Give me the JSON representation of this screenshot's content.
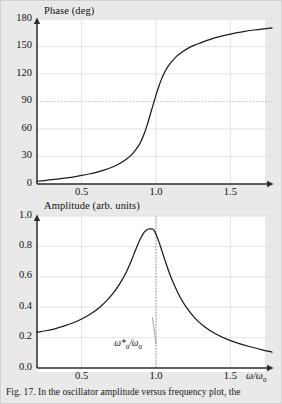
{
  "figure": {
    "background_color": "#e9e9e9",
    "plot_background_color": "#ffffff",
    "axis_color": "#2b2b2b",
    "grid_color": "#dcdcdc",
    "curve_color": "#1a1a1a",
    "caption": "Fig. 17. In the oscillator amplitude versus frequency plot, the"
  },
  "chart_data": [
    {
      "id": "phase-plot",
      "type": "line",
      "title": "",
      "xlabel": "",
      "ylabel": "Phase (deg)",
      "xlim": [
        0.2,
        1.78
      ],
      "ylim": [
        0,
        180
      ],
      "grid": true,
      "legend": "none",
      "xticks": [
        0.5,
        1.0,
        1.5
      ],
      "xticklabels": [
        "0.5",
        "1.0",
        "1.5"
      ],
      "yticks": [
        0,
        30,
        60,
        90,
        120,
        150,
        180
      ],
      "yticklabels": [
        "0",
        "30",
        "60",
        "90",
        "120",
        "150",
        "180"
      ],
      "highlight_gridline_y": 90,
      "series": [
        {
          "name": "phase",
          "x": [
            0.2,
            0.25,
            0.3,
            0.35,
            0.4,
            0.45,
            0.5,
            0.55,
            0.6,
            0.65,
            0.7,
            0.75,
            0.8,
            0.84,
            0.88,
            0.9,
            0.92,
            0.94,
            0.96,
            0.98,
            1.0,
            1.02,
            1.04,
            1.06,
            1.08,
            1.1,
            1.14,
            1.18,
            1.22,
            1.26,
            1.3,
            1.36,
            1.42,
            1.5,
            1.58,
            1.66,
            1.74,
            1.78
          ],
          "y": [
            3.0,
            3.8,
            4.7,
            5.6,
            6.7,
            7.9,
            9.3,
            10.9,
            12.8,
            15.1,
            18.0,
            21.8,
            27.0,
            32.6,
            41.0,
            47.0,
            54.5,
            64.0,
            75.0,
            86.0,
            97.0,
            107.0,
            115.5,
            122.5,
            128.0,
            132.5,
            139.5,
            144.5,
            148.5,
            151.5,
            154.0,
            157.5,
            160.5,
            163.5,
            166.0,
            168.0,
            169.5,
            170.2
          ]
        }
      ]
    },
    {
      "id": "amplitude-plot",
      "type": "line",
      "title": "",
      "xlabel": "ω/ω₀",
      "ylabel": "Amplitude (arb. units)",
      "xlim": [
        0.2,
        1.78
      ],
      "ylim": [
        0.0,
        1.0
      ],
      "grid": true,
      "legend": "none",
      "xticks": [
        0.5,
        1.0,
        1.5
      ],
      "xticklabels": [
        "0.5",
        "1.0",
        "1.5"
      ],
      "yticks": [
        0.0,
        0.2,
        0.4,
        0.6,
        0.8,
        1.0
      ],
      "yticklabels": [
        "0.0",
        "0.2",
        "0.4",
        "0.6",
        "0.8",
        "1.0"
      ],
      "vline_x": 1.0,
      "annotation": {
        "text": "ω*₀/ω₀",
        "base": "ω*",
        "sub1": "0",
        "mid": "/ω",
        "sub2": "0",
        "x": 0.8,
        "y": 0.145,
        "leader_to_x": 0.975,
        "leader_to_y": 0.335
      },
      "peak": {
        "x": 0.975,
        "y": 0.915
      },
      "series": [
        {
          "name": "amplitude",
          "x": [
            0.2,
            0.26,
            0.32,
            0.38,
            0.44,
            0.5,
            0.56,
            0.62,
            0.68,
            0.72,
            0.76,
            0.8,
            0.83,
            0.86,
            0.88,
            0.9,
            0.92,
            0.94,
            0.955,
            0.965,
            0.975,
            0.985,
            1.0,
            1.02,
            1.04,
            1.06,
            1.09,
            1.12,
            1.16,
            1.2,
            1.26,
            1.32,
            1.4,
            1.48,
            1.56,
            1.64,
            1.72,
            1.78
          ],
          "y": [
            0.235,
            0.245,
            0.258,
            0.275,
            0.296,
            0.322,
            0.355,
            0.398,
            0.455,
            0.502,
            0.56,
            0.63,
            0.695,
            0.77,
            0.818,
            0.86,
            0.892,
            0.91,
            0.915,
            0.916,
            0.915,
            0.908,
            0.88,
            0.83,
            0.77,
            0.71,
            0.625,
            0.552,
            0.47,
            0.405,
            0.33,
            0.277,
            0.225,
            0.188,
            0.16,
            0.138,
            0.118,
            0.105
          ]
        }
      ]
    }
  ]
}
